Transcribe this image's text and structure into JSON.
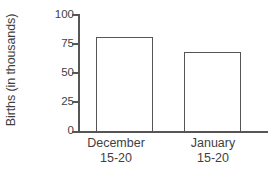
{
  "chart_data": {
    "type": "bar",
    "title": "",
    "xlabel": "",
    "ylabel": "Births (in thousands)",
    "categories": [
      "December 15-20",
      "January 15-20"
    ],
    "category_lines": [
      {
        "line1": "December",
        "line2": "15-20"
      },
      {
        "line1": "January",
        "line2": "15-20"
      }
    ],
    "values": [
      81,
      68
    ],
    "ylim": [
      0,
      100
    ],
    "yticks": [
      0,
      25,
      50,
      75,
      100
    ],
    "ytick_labels": [
      "0",
      "25",
      "50",
      "75",
      "100"
    ],
    "grid": false,
    "legend": false,
    "bar_fill_color": "#ffffff",
    "bar_edge_color": "#555555",
    "axis_color": "#565656",
    "text_color": "#3f3f3f",
    "background_color": "#ffffff"
  }
}
